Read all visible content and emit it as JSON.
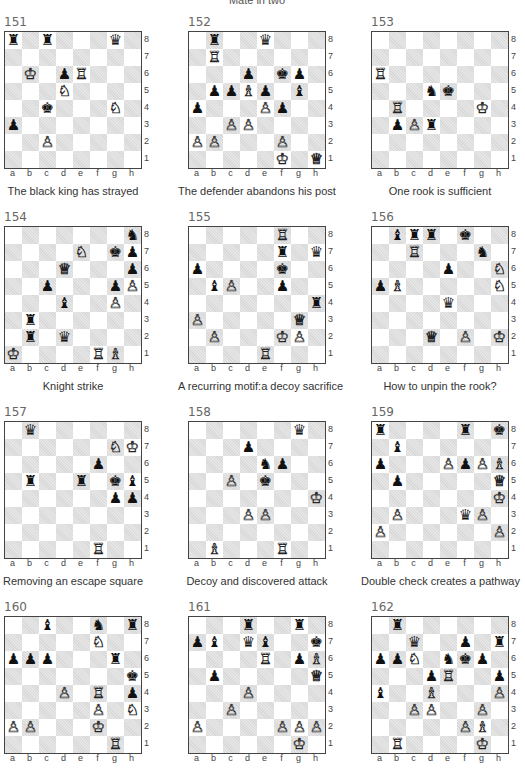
{
  "page": {
    "title": "Mate in two"
  },
  "files": [
    "a",
    "b",
    "c",
    "d",
    "e",
    "f",
    "g",
    "h"
  ],
  "ranks": [
    "8",
    "7",
    "6",
    "5",
    "4",
    "3",
    "2",
    "1"
  ],
  "piece_glyphs": {
    "K": "♔",
    "Q": "♕",
    "R": "♖",
    "B": "♗",
    "N": "♘",
    "P": "♙",
    "k": "♚",
    "q": "♛",
    "r": "♜",
    "b": "♝",
    "n": "♞",
    "p": "♟"
  },
  "colors": {
    "light_square": "#ffffff",
    "dark_square": "#d9d9d9",
    "border": "#444444"
  },
  "puzzles": [
    {
      "number": "151",
      "caption": "The black king has strayed",
      "pieces": {
        "a8": "r",
        "c8": "r",
        "g8": "q",
        "b6": "K",
        "d6": "p",
        "e6": "R",
        "d5": "N",
        "c4": "k",
        "g4": "N",
        "a3": "p",
        "c2": "P"
      }
    },
    {
      "number": "152",
      "caption": "The defender abandons his post",
      "pieces": {
        "b8": "r",
        "e8": "q",
        "b7": "R",
        "d6": "p",
        "f6": "k",
        "g6": "p",
        "b5": "p",
        "c5": "p",
        "d5": "B",
        "e5": "p",
        "g5": "b",
        "a4": "p",
        "e4": "P",
        "f4": "p",
        "c3": "P",
        "d3": "P",
        "a2": "P",
        "b2": "P",
        "f2": "P",
        "f1": "K",
        "h1": "Q"
      }
    },
    {
      "number": "153",
      "caption": "One rook is sufficient",
      "pieces": {
        "a6": "R",
        "d5": "n",
        "e5": "k",
        "b4": "R",
        "g4": "K",
        "b3": "p",
        "c3": "P",
        "d3": "r"
      }
    },
    {
      "number": "154",
      "caption": "Knight strike",
      "pieces": {
        "h8": "n",
        "e7": "N",
        "g7": "k",
        "h7": "p",
        "d6": "Q",
        "h6": "p",
        "c5": "p",
        "g5": "p",
        "h5": "P",
        "d4": "b",
        "g4": "P",
        "b3": "r",
        "b2": "r",
        "d2": "q",
        "a1": "K",
        "f1": "R",
        "g1": "B"
      }
    },
    {
      "number": "155",
      "caption": "A recurring motif:a decoy sacrifice",
      "pieces": {
        "f8": "R",
        "f7": "r",
        "h7": "q",
        "a6": "p",
        "f6": "k",
        "b5": "b",
        "c5": "P",
        "f5": "p",
        "h4": "r",
        "a3": "P",
        "g3": "Q",
        "b2": "P",
        "f2": "K",
        "g2": "P",
        "e1": "R"
      }
    },
    {
      "number": "156",
      "caption": "How to unpin the rook?",
      "pieces": {
        "b8": "b",
        "c8": "r",
        "d8": "r",
        "f8": "k",
        "c7": "R",
        "g7": "n",
        "e6": "p",
        "h6": "N",
        "a5": "p",
        "b5": "B",
        "h5": "N",
        "e4": "q",
        "d2": "Q",
        "f2": "P",
        "h2": "K"
      }
    },
    {
      "number": "157",
      "caption": "Removing an escape square",
      "pieces": {
        "b8": "q",
        "g7": "N",
        "h7": "K",
        "f6": "p",
        "b5": "r",
        "e5": "r",
        "g5": "k",
        "h5": "b",
        "g4": "p",
        "h4": "p",
        "f1": "R"
      }
    },
    {
      "number": "158",
      "caption": "Decoy and discovered attack",
      "pieces": {
        "g8": "q",
        "d7": "p",
        "e6": "n",
        "f6": "p",
        "c5": "P",
        "e5": "k",
        "h4": "K",
        "d3": "P",
        "e3": "P",
        "b1": "B",
        "f1": "R"
      }
    },
    {
      "number": "159",
      "caption": "Double check creates a pathway",
      "pieces": {
        "a8": "r",
        "f8": "r",
        "h8": "k",
        "b7": "b",
        "a6": "p",
        "e6": "P",
        "f6": "p",
        "g6": "P",
        "h6": "B",
        "b5": "p",
        "h5": "Q",
        "h4": "K",
        "b3": "P",
        "f3": "q",
        "g3": "P",
        "a2": "P",
        "h2": "P"
      }
    },
    {
      "number": "160",
      "caption": "",
      "pieces": {
        "c8": "b",
        "f8": "n",
        "h8": "r",
        "f7": "N",
        "a6": "p",
        "b6": "p",
        "c6": "p",
        "g6": "r",
        "h5": "k",
        "d4": "P",
        "f4": "R",
        "h4": "p",
        "f3": "P",
        "h3": "N",
        "a2": "P",
        "b2": "P",
        "f2": "K",
        "g1": "R"
      }
    },
    {
      "number": "161",
      "caption": "",
      "pieces": {
        "d8": "r",
        "g8": "r",
        "a7": "p",
        "b7": "b",
        "d7": "q",
        "e7": "b",
        "h7": "k",
        "e6": "R",
        "g6": "p",
        "h6": "B",
        "b5": "p",
        "h5": "Q",
        "d4": "P",
        "c3": "P",
        "a2": "P",
        "f2": "P",
        "g2": "P",
        "h2": "P",
        "g1": "K"
      }
    },
    {
      "number": "162",
      "caption": "",
      "pieces": {
        "b8": "r",
        "c7": "q",
        "f7": "p",
        "h7": "r",
        "a6": "p",
        "b6": "p",
        "c6": "N",
        "e6": "n",
        "f6": "k",
        "g6": "p",
        "d5": "p",
        "e5": "R",
        "h5": "p",
        "a4": "b",
        "d4": "B",
        "h4": "P",
        "c3": "P",
        "d3": "P",
        "g3": "P",
        "f2": "P",
        "g2": "B",
        "b1": "R",
        "g1": "K"
      }
    }
  ]
}
